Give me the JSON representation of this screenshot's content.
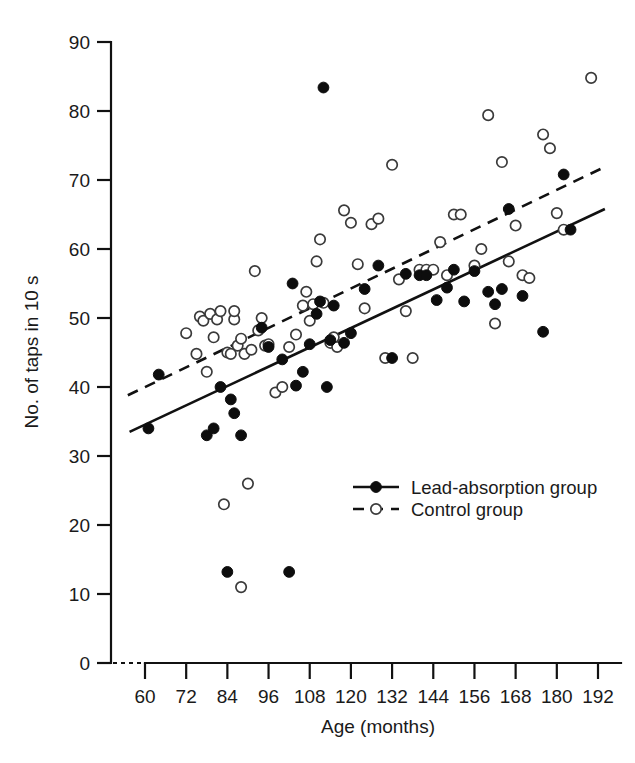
{
  "chart_data": {
    "type": "scatter",
    "title": "",
    "xlabel": "Age (months)",
    "ylabel": "No. of taps in 10 s",
    "xlim": [
      54,
      198
    ],
    "ylim": [
      0,
      90
    ],
    "xticks": [
      60,
      72,
      84,
      96,
      108,
      120,
      132,
      144,
      156,
      168,
      180,
      192
    ],
    "yticks": [
      0,
      10,
      20,
      30,
      40,
      50,
      60,
      70,
      80,
      90
    ],
    "grid": false,
    "axis_break_x": true,
    "legend_position": "inside-lower-right",
    "series": [
      {
        "name": "Lead-absorption group",
        "marker": "filled-circle",
        "line_style": "solid",
        "color": "#0d0d0d",
        "points": [
          [
            61,
            34.0
          ],
          [
            64,
            41.8
          ],
          [
            78,
            33.0
          ],
          [
            80,
            34.0
          ],
          [
            82,
            40.0
          ],
          [
            84,
            13.2
          ],
          [
            85,
            38.2
          ],
          [
            86,
            36.2
          ],
          [
            88,
            33.0
          ],
          [
            94,
            48.6
          ],
          [
            96,
            45.8
          ],
          [
            100,
            44.0
          ],
          [
            102,
            13.2
          ],
          [
            103,
            55.0
          ],
          [
            104,
            40.2
          ],
          [
            106,
            42.2
          ],
          [
            108,
            46.2
          ],
          [
            110,
            50.6
          ],
          [
            111,
            52.4
          ],
          [
            112,
            83.4
          ],
          [
            113,
            40.0
          ],
          [
            114,
            46.8
          ],
          [
            115,
            51.8
          ],
          [
            118,
            46.4
          ],
          [
            120,
            47.8
          ],
          [
            124,
            54.2
          ],
          [
            128,
            57.6
          ],
          [
            132,
            44.2
          ],
          [
            136,
            56.4
          ],
          [
            140,
            56.2
          ],
          [
            142,
            56.2
          ],
          [
            145,
            52.6
          ],
          [
            148,
            54.4
          ],
          [
            150,
            57.0
          ],
          [
            153,
            52.4
          ],
          [
            156,
            56.8
          ],
          [
            160,
            53.8
          ],
          [
            162,
            52.0
          ],
          [
            164,
            54.2
          ],
          [
            166,
            65.8
          ],
          [
            170,
            53.2
          ],
          [
            176,
            48.0
          ],
          [
            182,
            70.8
          ],
          [
            184,
            62.8
          ]
        ],
        "fit_line": {
          "x": [
            55.5,
            194
          ],
          "y": [
            33.5,
            65.8
          ]
        }
      },
      {
        "name": "Control group",
        "marker": "open-circle",
        "line_style": "dashed",
        "color": "#3a3a3a",
        "points": [
          [
            72,
            47.8
          ],
          [
            75,
            44.8
          ],
          [
            76,
            50.2
          ],
          [
            77,
            49.6
          ],
          [
            78,
            42.2
          ],
          [
            79,
            50.6
          ],
          [
            80,
            47.2
          ],
          [
            81,
            49.8
          ],
          [
            82,
            51.0
          ],
          [
            83,
            23.0
          ],
          [
            84,
            45.0
          ],
          [
            85,
            44.8
          ],
          [
            86,
            49.8
          ],
          [
            86,
            51.0
          ],
          [
            87,
            46.0
          ],
          [
            88,
            11.0
          ],
          [
            88,
            47.0
          ],
          [
            89,
            44.8
          ],
          [
            90,
            26.0
          ],
          [
            91,
            45.4
          ],
          [
            92,
            56.8
          ],
          [
            93,
            48.2
          ],
          [
            94,
            50.0
          ],
          [
            95,
            46.0
          ],
          [
            96,
            46.2
          ],
          [
            98,
            39.2
          ],
          [
            100,
            40.0
          ],
          [
            102,
            45.8
          ],
          [
            104,
            47.6
          ],
          [
            106,
            51.8
          ],
          [
            107,
            53.8
          ],
          [
            108,
            49.6
          ],
          [
            109,
            52.0
          ],
          [
            110,
            58.2
          ],
          [
            111,
            61.4
          ],
          [
            112,
            52.2
          ],
          [
            114,
            46.4
          ],
          [
            115,
            47.2
          ],
          [
            116,
            45.8
          ],
          [
            118,
            65.6
          ],
          [
            120,
            63.8
          ],
          [
            122,
            57.8
          ],
          [
            124,
            51.4
          ],
          [
            126,
            63.6
          ],
          [
            128,
            64.4
          ],
          [
            130,
            44.2
          ],
          [
            132,
            72.2
          ],
          [
            134,
            55.6
          ],
          [
            136,
            51.0
          ],
          [
            138,
            44.2
          ],
          [
            140,
            57.0
          ],
          [
            142,
            57.0
          ],
          [
            144,
            57.0
          ],
          [
            146,
            61.0
          ],
          [
            148,
            56.2
          ],
          [
            150,
            65.0
          ],
          [
            152,
            65.0
          ],
          [
            156,
            57.6
          ],
          [
            158,
            60.0
          ],
          [
            160,
            79.4
          ],
          [
            162,
            49.2
          ],
          [
            164,
            72.6
          ],
          [
            166,
            58.2
          ],
          [
            168,
            63.4
          ],
          [
            170,
            56.2
          ],
          [
            172,
            55.8
          ],
          [
            176,
            76.6
          ],
          [
            178,
            74.6
          ],
          [
            180,
            65.2
          ],
          [
            182,
            62.8
          ],
          [
            190,
            84.8
          ]
        ],
        "fit_line": {
          "x": [
            55,
            194
          ],
          "y": [
            38.8,
            71.9
          ]
        }
      }
    ]
  },
  "axes": {
    "y_title": "No. of taps in 10 s",
    "x_title": "Age (months)",
    "y_tick_labels": [
      "0",
      "10",
      "20",
      "30",
      "40",
      "50",
      "60",
      "70",
      "80",
      "90"
    ],
    "x_tick_labels": [
      "60",
      "72",
      "84",
      "96",
      "108",
      "120",
      "132",
      "144",
      "156",
      "168",
      "180",
      "192"
    ]
  },
  "legend": {
    "items": [
      {
        "label": "Lead-absorption group",
        "marker": "filled-circle",
        "line": "solid"
      },
      {
        "label": "Control group",
        "marker": "open-circle",
        "line": "dashed"
      }
    ]
  }
}
